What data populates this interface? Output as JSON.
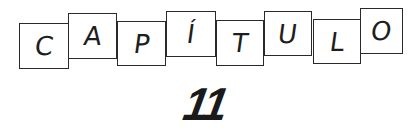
{
  "heading": {
    "word": "CAPÍTULO",
    "letters": [
      "C",
      "A",
      "P",
      "Í",
      "T",
      "U",
      "L",
      "O"
    ],
    "number": "11"
  },
  "colors": {
    "ink": "#1e1e1e",
    "background": "#ffffff"
  }
}
